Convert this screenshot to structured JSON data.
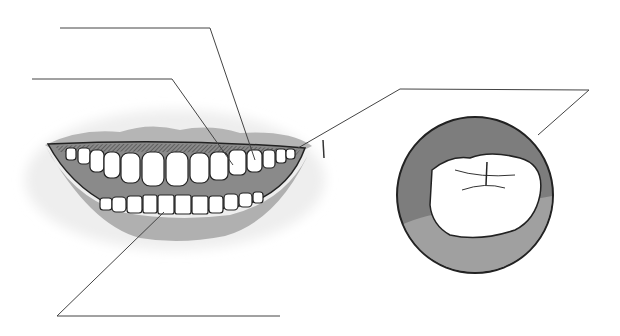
{
  "diagram": {
    "label_lines": [
      {
        "id": "label-line-1",
        "text": ""
      },
      {
        "id": "label-line-2",
        "text": ""
      },
      {
        "id": "label-line-3",
        "text": ""
      },
      {
        "id": "label-line-4",
        "text": ""
      }
    ],
    "colors": {
      "lip": "#b0b0b0",
      "gum": "#8a8a8a",
      "tooth": "#ffffff",
      "circle_bg": "#7d7d7d",
      "circle_gum": "#9a9a9a",
      "line": "#444444"
    }
  }
}
